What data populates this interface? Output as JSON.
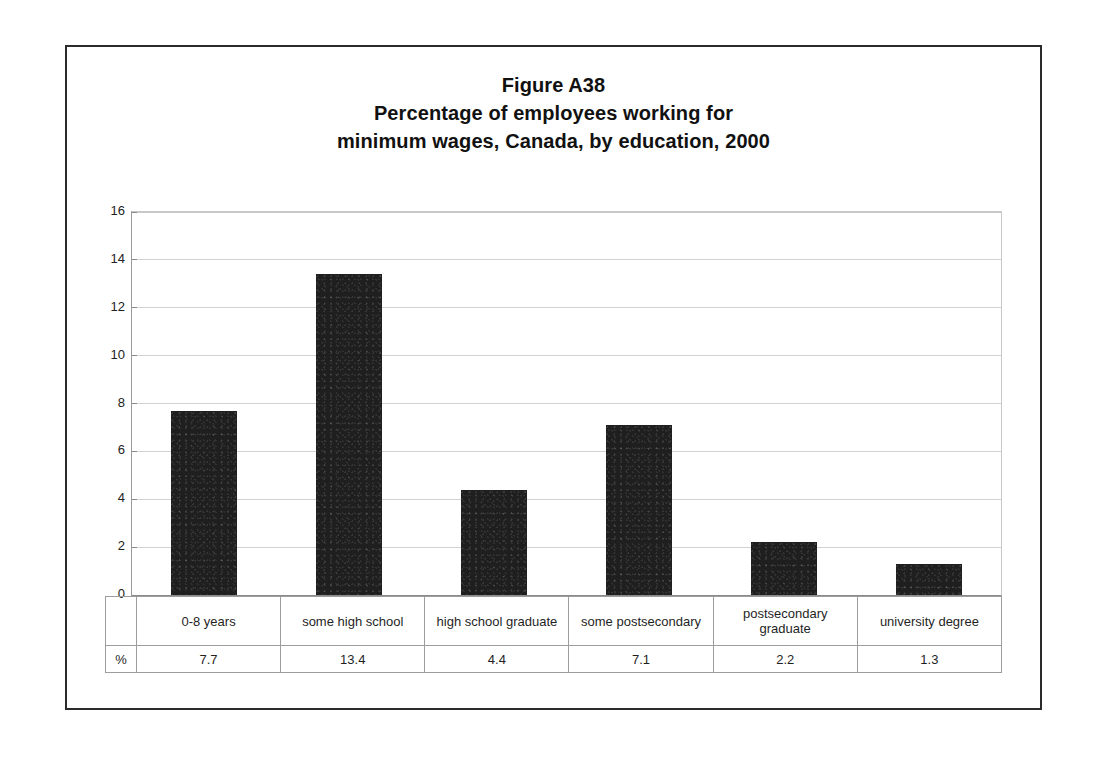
{
  "figure": {
    "title_lines": [
      "Figure A38",
      "Percentage of employees working for",
      "minimum wages, Canada, by education, 2000"
    ],
    "row_header": "%"
  },
  "chart_data": {
    "type": "bar",
    "title": "Figure A38 Percentage of employees working for minimum wages, Canada, by education, 2000",
    "xlabel": "",
    "ylabel": "",
    "ylim": [
      0,
      16
    ],
    "yticks": [
      0,
      2,
      4,
      6,
      8,
      10,
      12,
      14,
      16
    ],
    "ytick_labels": [
      "0",
      "2",
      "4",
      "6",
      "8",
      "10",
      "12",
      "14",
      "16"
    ],
    "grid": true,
    "legend": false,
    "bar_color": "#1f1f1f",
    "categories": [
      "0-8 years",
      "some high school",
      "high school graduate",
      "some postsecondary",
      "postsecondary graduate",
      "university degree"
    ],
    "values": [
      7.7,
      13.4,
      4.4,
      7.1,
      2.2,
      1.3
    ],
    "value_labels": [
      "7.7",
      "13.4",
      "4.4",
      "7.1",
      "2.2",
      "1.3"
    ]
  }
}
